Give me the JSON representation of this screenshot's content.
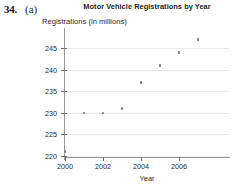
{
  "exercise": {
    "number": "34.",
    "part": "(a)"
  },
  "chart_data": {
    "type": "scatter",
    "title": "Motor Vehicle Registrations by Year",
    "xlabel": "Year",
    "ylabel": "Registrations (in millions)",
    "x": [
      2000,
      2001,
      2002,
      2003,
      2004,
      2005,
      2006,
      2007
    ],
    "values": [
      221,
      230,
      230,
      231,
      237,
      241,
      244,
      247
    ],
    "xlim": [
      2000,
      2007
    ],
    "ylim": [
      220,
      248
    ],
    "xticks": [
      2000,
      2002,
      2004,
      2006
    ],
    "xtick_labels": [
      "2000",
      "2002",
      "2004",
      "2006"
    ],
    "yticks": [
      220,
      225,
      230,
      235,
      240,
      245
    ],
    "ytick_labels": [
      "220",
      "225",
      "230",
      "235",
      "240",
      "245"
    ],
    "grid": true,
    "grid_axis": "y",
    "legend": null,
    "marker_color": "#8a8a8a",
    "grid_color": "#e9e9e9",
    "axis_color": "#9a9a9a"
  }
}
